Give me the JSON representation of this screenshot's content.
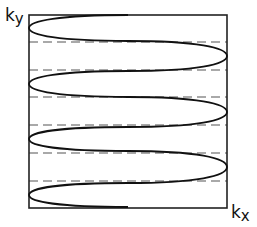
{
  "diagram": {
    "type": "k-space trajectory (EPI-like raster with curved turns)",
    "axes": {
      "y_label": "k",
      "y_subscript": "y",
      "x_label": "k",
      "x_subscript": "x"
    },
    "box": {
      "left": 29,
      "top": 15,
      "right": 227,
      "bottom": 208
    },
    "trajectory": {
      "stroke": "#111111",
      "start": [
        128,
        15
      ],
      "end": [
        128,
        208
      ],
      "left_turns_y": [
        28,
        84,
        139,
        195
      ],
      "right_turns_y": [
        56,
        112,
        167
      ]
    },
    "dashed_lines": {
      "stroke": "#555555",
      "y": [
        42,
        70,
        97,
        125,
        153,
        181
      ]
    }
  }
}
